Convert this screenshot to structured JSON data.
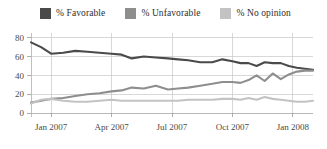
{
  "legend": {
    "position": "top-center",
    "items": [
      {
        "label": "% Favorable",
        "color": "#4a4a4a",
        "swatch_name": "legend-swatch-favorable"
      },
      {
        "label": "% Unfavorable",
        "color": "#8e8e8e",
        "swatch_name": "legend-swatch-unfavorable"
      },
      {
        "label": "% No opinion",
        "color": "#c3c3c3",
        "swatch_name": "legend-swatch-no-opinion"
      }
    ]
  },
  "chart_data": {
    "type": "line",
    "title": "",
    "subtitle": "",
    "xlabel": "",
    "ylabel": "",
    "ylim": [
      0,
      85
    ],
    "yticks": [
      0,
      20,
      40,
      60,
      80
    ],
    "ytick_labels": [
      "0",
      "20",
      "40",
      "60",
      "80"
    ],
    "xtick_labels": [
      "Jan 2007",
      "Apr 2007",
      "Jul 2007",
      "Oct 2007",
      "Jan 2008"
    ],
    "xtick_positions": [
      1,
      4,
      7,
      10,
      13
    ],
    "xlim": [
      0,
      14
    ],
    "grid": "both",
    "legend_position": "top-center",
    "x": [
      0,
      0.5,
      1,
      1.6,
      2.2,
      2.8,
      3.4,
      4,
      4.5,
      5,
      5.6,
      6.2,
      6.8,
      7.3,
      7.8,
      8.4,
      9,
      9.5,
      10,
      10.4,
      10.8,
      11.2,
      11.6,
      12,
      12.4,
      12.8,
      13.2,
      13.6,
      14
    ],
    "series": [
      {
        "name": "% Favorable",
        "color": "#4a4a4a",
        "values": [
          75,
          70,
          63,
          64,
          66,
          65,
          64,
          63,
          62,
          58,
          60,
          59,
          58,
          57,
          56,
          54,
          54,
          57,
          55,
          53,
          53,
          50,
          54,
          53,
          53,
          50,
          48,
          47,
          46
        ]
      },
      {
        "name": "% Unfavorable",
        "color": "#8e8e8e",
        "values": [
          11,
          13,
          15,
          16,
          18,
          20,
          21,
          23,
          24,
          27,
          26,
          29,
          25,
          26,
          27,
          29,
          31,
          33,
          33,
          32,
          35,
          40,
          34,
          42,
          36,
          41,
          44,
          45,
          45
        ]
      },
      {
        "name": "% No opinion",
        "color": "#c3c3c3",
        "values": [
          10,
          14,
          15,
          13,
          12,
          12,
          13,
          14,
          13,
          13,
          13,
          13,
          13,
          13,
          14,
          14,
          14,
          15,
          15,
          14,
          16,
          14,
          17,
          15,
          14,
          13,
          12,
          12,
          13
        ]
      }
    ]
  }
}
